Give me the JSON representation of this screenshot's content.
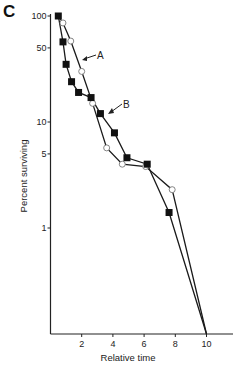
{
  "panel_label": "C",
  "chart_data": {
    "type": "line",
    "title": "",
    "xlabel": "Relative time",
    "ylabel": "Percent surviving",
    "xscale": "linear",
    "yscale": "log",
    "xlim": [
      0,
      11.8
    ],
    "ylim": [
      0.1,
      100
    ],
    "x_ticks": [
      2,
      4,
      6,
      8,
      10
    ],
    "y_ticks": [
      100,
      50,
      10,
      5,
      1
    ],
    "y_tick_labels": [
      "100",
      "50",
      "10",
      "5",
      "1"
    ],
    "x_tick_labels": [
      "2",
      "4",
      "6",
      "8",
      "10"
    ],
    "grid": false,
    "legend": "inline arrow labels",
    "series": [
      {
        "name": "A",
        "marker": "open-circle",
        "x": [
          0.5,
          0.8,
          1.3,
          2.0,
          2.7,
          3.6,
          4.6,
          6.1,
          7.8,
          10.0
        ],
        "values": [
          100,
          86,
          58,
          30,
          15,
          5.7,
          4.0,
          3.8,
          2.3,
          0.1
        ]
      },
      {
        "name": "B",
        "marker": "filled-square",
        "x": [
          0.5,
          0.8,
          1.0,
          1.35,
          1.8,
          2.6,
          3.2,
          4.1,
          4.9,
          6.2,
          7.6,
          10.0
        ],
        "values": [
          100,
          57,
          35,
          24,
          19,
          17,
          12,
          7.9,
          4.6,
          4.0,
          1.4,
          0.1
        ]
      }
    ],
    "annotations": [
      {
        "text": "A",
        "points_to_series": "A"
      },
      {
        "text": "B",
        "points_to_series": "B"
      }
    ]
  }
}
